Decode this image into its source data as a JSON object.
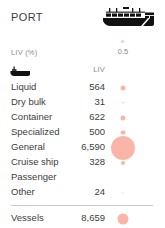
{
  "header": {
    "title": "PORT",
    "ship_icon": "cargo-ship-icon"
  },
  "legend": {
    "label": "LIV (%)",
    "scale_value": "0.5",
    "dot_color": "#f6c9bf"
  },
  "columns": {
    "icon": "boat-icon",
    "value_header": "LIV"
  },
  "chart_data": {
    "type": "table",
    "title": "PORT",
    "xlabel": "",
    "ylabel": "LIV",
    "legend": "LIV (%)",
    "legend_reference_value": 0.5,
    "bubble_color": "#f79a86",
    "categories": [
      "Liquid",
      "Dry bulk",
      "Container",
      "Specialized",
      "General",
      "Cruise ship",
      "Passenger",
      "Other"
    ],
    "values": [
      564,
      31,
      622,
      500,
      6590,
      328,
      null,
      24
    ],
    "value_labels": [
      "564",
      "31",
      "622",
      "500",
      "6,590",
      "328",
      "",
      "24"
    ],
    "total_label": "Vessels",
    "total_value": 8659,
    "total_value_label": "8,659"
  },
  "rows": [
    {
      "label": "Liquid",
      "value": "564",
      "bubble": 5.0
    },
    {
      "label": "Dry bulk",
      "value": "31",
      "bubble": 1.6
    },
    {
      "label": "Container",
      "value": "622",
      "bubble": 5.2
    },
    {
      "label": "Specialized",
      "value": "500",
      "bubble": 4.8
    },
    {
      "label": "General",
      "value": "6,590",
      "bubble": 24.0
    },
    {
      "label": "Cruise ship",
      "value": "328",
      "bubble": 4.0
    },
    {
      "label": "Passenger",
      "value": "",
      "bubble": 0
    },
    {
      "label": "Other",
      "value": "24",
      "bubble": 1.4
    }
  ],
  "total": {
    "label": "Vessels",
    "value": "8,659",
    "bubble": 11.0
  }
}
